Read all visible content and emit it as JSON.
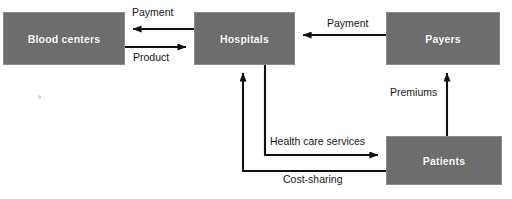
{
  "diagram": {
    "canvas": {
      "width": 512,
      "height": 199
    },
    "colors": {
      "node_fill": "#6d6d6d",
      "node_border": "#8a8a8a",
      "node_text": "#ffffff",
      "edge_line": "#101010",
      "background": "#ffffff",
      "edge_text": "#151515"
    },
    "nodes": [
      {
        "id": "blood-centers",
        "label": "Blood centers",
        "x": 3,
        "y": 12,
        "width": 122,
        "height": 53
      },
      {
        "id": "hospitals",
        "label": "Hospitals",
        "x": 194,
        "y": 12,
        "width": 101,
        "height": 53
      },
      {
        "id": "payers",
        "label": "Payers",
        "x": 386,
        "y": 12,
        "width": 114,
        "height": 53
      },
      {
        "id": "patients",
        "label": "Patients",
        "x": 386,
        "y": 136,
        "width": 116,
        "height": 49
      }
    ],
    "edges": [
      {
        "id": "payment-to-blood-centers",
        "label": "Payment",
        "from": "hospitals",
        "to": "blood-centers",
        "label_x": 130,
        "label_y": 6
      },
      {
        "id": "product-to-hospitals",
        "label": "Product",
        "from": "blood-centers",
        "to": "hospitals",
        "label_x": 131,
        "label_y": 51
      },
      {
        "id": "payment-to-hospitals",
        "label": "Payment",
        "from": "payers",
        "to": "hospitals",
        "label_x": 325,
        "label_y": 17
      },
      {
        "id": "premiums-to-payers",
        "label": "Premiums",
        "from": "patients",
        "to": "payers",
        "label_x": 388,
        "label_y": 86
      },
      {
        "id": "health-care-services",
        "label": "Health care services",
        "from": "hospitals",
        "to": "patients",
        "label_x": 268,
        "label_y": 135
      },
      {
        "id": "cost-sharing-to-hospitals",
        "label": "Cost-sharing",
        "from": "patients",
        "to": "hospitals",
        "label_x": 281,
        "label_y": 173
      }
    ]
  }
}
